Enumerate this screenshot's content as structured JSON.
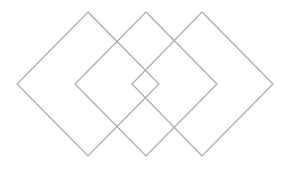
{
  "diagram": {
    "width": 290,
    "height": 170,
    "background": "#ffffff",
    "stroke_color": "#a8a8a8",
    "stroke_width": 1.2,
    "shapes": [
      {
        "name": "diamond-left",
        "type": "diamond",
        "points": [
          [
            88,
            12
          ],
          [
            159,
            84
          ],
          [
            88,
            156
          ],
          [
            17,
            84
          ]
        ]
      },
      {
        "name": "diamond-middle",
        "type": "diamond",
        "points": [
          [
            146,
            12
          ],
          [
            217,
            84
          ],
          [
            146,
            156
          ],
          [
            75,
            84
          ]
        ]
      },
      {
        "name": "diamond-right",
        "type": "diamond",
        "points": [
          [
            202,
            12
          ],
          [
            273,
            84
          ],
          [
            202,
            156
          ],
          [
            132,
            84
          ]
        ]
      }
    ]
  }
}
